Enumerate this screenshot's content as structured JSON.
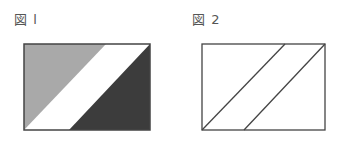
{
  "figures": [
    {
      "label": "図 l",
      "shapes": {
        "rect": {
          "x1": 24,
          "y1": 44,
          "x2": 150,
          "y2": 130
        },
        "gray_triangle": {
          "points": "24,44 106,44 24,130",
          "fill": "#a9a9a9"
        },
        "dark_triangle": {
          "points": "150,44 150,130 69,130",
          "fill": "#3c3c3c"
        },
        "white_band": {
          "fill": "#ffffff"
        }
      }
    },
    {
      "label": "図 2",
      "shapes": {
        "rect": {
          "x1": 202,
          "y1": 44,
          "x2": 325,
          "y2": 130
        },
        "line_1": {
          "x1": 202,
          "y1": 130,
          "x2": 285,
          "y2": 44
        },
        "line_2": {
          "x1": 244,
          "y1": 130,
          "x2": 325,
          "y2": 44
        }
      }
    }
  ],
  "colors": {
    "stroke": "#444444",
    "gray_fill": "#a9a9a9",
    "dark_fill": "#3c3c3c",
    "label_text": "#555555"
  }
}
